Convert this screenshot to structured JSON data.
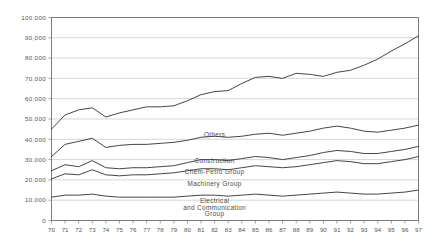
{
  "chart_data": {
    "type": "line",
    "title": "",
    "xlabel": "",
    "ylabel": "",
    "ylim": [
      0,
      100000
    ],
    "xlim": [
      70,
      97
    ],
    "grid": true,
    "legend_position": "inline-annotations",
    "categories": [
      "70",
      "71",
      "72",
      "73",
      "74",
      "75",
      "76",
      "77",
      "78",
      "79",
      "80",
      "81",
      "82",
      "83",
      "84",
      "85",
      "86",
      "87",
      "88",
      "89",
      "90",
      "91",
      "92",
      "93",
      "94",
      "95",
      "96",
      "97"
    ],
    "ytick_labels": [
      "0",
      "10,000",
      "20,000",
      "30,000",
      "40,000",
      "50,000",
      "60,000",
      "70,000",
      "80,000",
      "90,000",
      "100,000"
    ],
    "ytick_values": [
      0,
      10000,
      20000,
      30000,
      40000,
      50000,
      60000,
      70000,
      80000,
      90000,
      100000
    ],
    "series": [
      {
        "name": "Others",
        "label": "Others",
        "values": [
          45000,
          52000,
          54500,
          55500,
          51000,
          53000,
          54500,
          56000,
          56000,
          56500,
          59000,
          62000,
          63500,
          64000,
          67500,
          70500,
          71000,
          70000,
          72500,
          72000,
          71000,
          73000,
          74000,
          76500,
          79500,
          83500,
          87000,
          91000
        ]
      },
      {
        "name": "Construction",
        "label": "Construction",
        "values": [
          31500,
          37500,
          39000,
          40500,
          36000,
          37000,
          37500,
          37500,
          38000,
          38500,
          39500,
          41000,
          41500,
          41000,
          41500,
          42500,
          43000,
          42000,
          43000,
          44000,
          45500,
          46500,
          45500,
          44000,
          43500,
          44500,
          45500,
          47000
        ]
      },
      {
        "name": "Chem-Petro Group",
        "label": "Chem-Petro Group",
        "values": [
          24500,
          27500,
          26500,
          29500,
          26000,
          25500,
          26000,
          26000,
          26500,
          27000,
          28500,
          30000,
          30000,
          29500,
          30500,
          31500,
          31000,
          30000,
          31000,
          32000,
          33500,
          34500,
          34000,
          33000,
          33000,
          34000,
          35000,
          36500
        ]
      },
      {
        "name": "Machinery Group",
        "label": "Machinery Group",
        "values": [
          20500,
          23000,
          22500,
          25000,
          22500,
          22000,
          22500,
          22500,
          23000,
          23500,
          24500,
          25500,
          25500,
          25000,
          26000,
          27000,
          26500,
          26000,
          26500,
          27500,
          28500,
          29500,
          29000,
          28000,
          28000,
          29000,
          30000,
          31500
        ]
      },
      {
        "name": "Electrical and Communication Group",
        "label": "Electrical\nand Communication\nGroup",
        "values": [
          11500,
          12500,
          12500,
          13000,
          12000,
          11500,
          11500,
          11500,
          11500,
          11500,
          12000,
          12500,
          12500,
          12000,
          12500,
          13000,
          12500,
          12000,
          12500,
          13000,
          13500,
          14000,
          13500,
          13000,
          13000,
          13500,
          14000,
          15000
        ]
      }
    ],
    "annotations": [
      {
        "text": "Others",
        "x_index": 12,
        "value": 41000
      },
      {
        "text": "Construction",
        "x_index": 12,
        "value": 28500
      },
      {
        "text": "Chem-Petro Group",
        "x_index": 12,
        "value": 22800
      },
      {
        "text": "Machinery Group",
        "x_index": 12,
        "value": 17200
      },
      {
        "text": "Electrical",
        "x_index": 12,
        "value": 8500
      },
      {
        "text": "and Communication",
        "x_index": 12,
        "value": 5400
      },
      {
        "text": "Group",
        "x_index": 12,
        "value": 2300
      }
    ],
    "colors": {
      "line": "#3b3b3b",
      "grid": "#b9b9b9",
      "frame": "#6f6f6f",
      "text": "#555555",
      "background": "#ffffff"
    }
  }
}
